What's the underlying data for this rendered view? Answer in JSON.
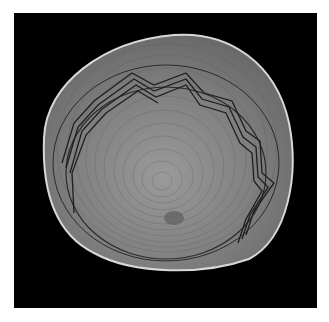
{
  "image": {
    "subject": "coiled woven basket viewed from above",
    "background_color": "#000000",
    "page_color": "#ffffff",
    "basket_color": "#7a7a7a",
    "rim_color": "#d8d8d8",
    "pattern_color": "#1e1e1e"
  }
}
